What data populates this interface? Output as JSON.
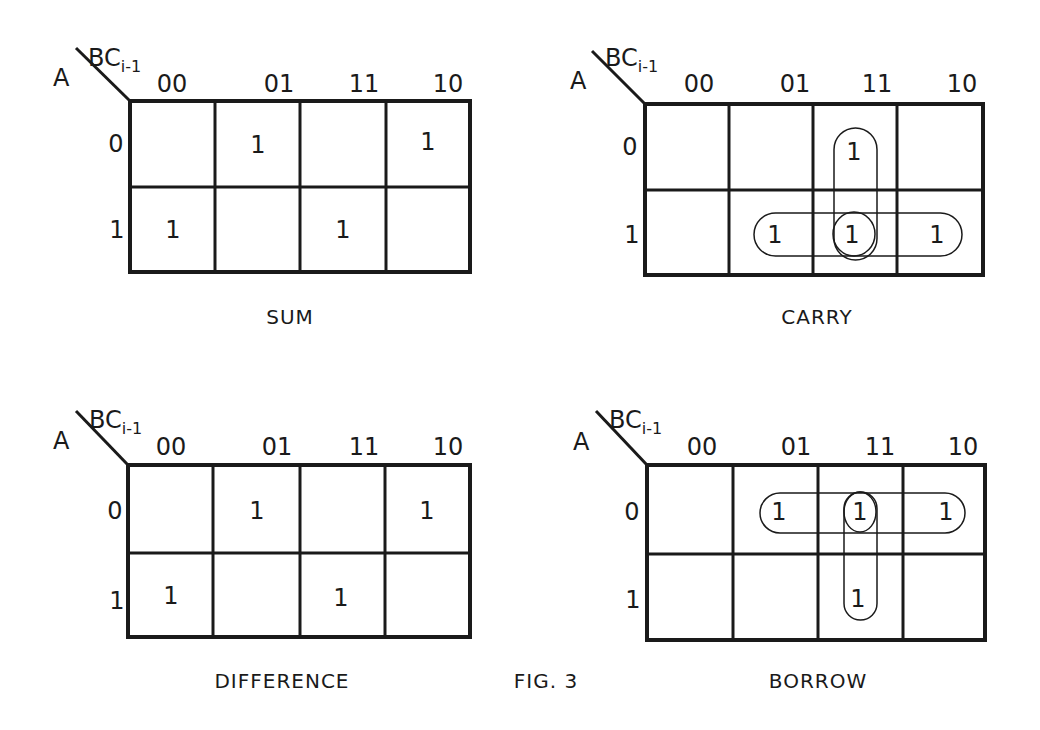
{
  "figure": {
    "label": "FIG. 3",
    "row_var": "A",
    "col_var": "BC",
    "col_var_sub": "i-1",
    "col_headers": [
      "00",
      "01",
      "11",
      "10"
    ],
    "row_headers": [
      "0",
      "1"
    ]
  },
  "maps": [
    {
      "id": "sum",
      "caption": "SUM",
      "cells": [
        [
          "",
          "1",
          "",
          "1"
        ],
        [
          "1",
          "",
          "1",
          ""
        ]
      ],
      "groups": []
    },
    {
      "id": "carry",
      "caption": "CARRY",
      "cells": [
        [
          "",
          "",
          "1",
          ""
        ],
        [
          "",
          "1",
          "1",
          "1"
        ]
      ],
      "groups": [
        {
          "type": "vertical",
          "col": "11",
          "rows": [
            "0",
            "1"
          ]
        },
        {
          "type": "horizontal",
          "row": "1",
          "cols": [
            "01",
            "11",
            "10"
          ]
        },
        {
          "type": "single",
          "row": "1",
          "col": "11"
        }
      ]
    },
    {
      "id": "difference",
      "caption": "DIFFERENCE",
      "cells": [
        [
          "",
          "1",
          "",
          "1"
        ],
        [
          "1",
          "",
          "1",
          ""
        ]
      ],
      "groups": []
    },
    {
      "id": "borrow",
      "caption": "BORROW",
      "cells": [
        [
          "",
          "1",
          "1",
          "1"
        ],
        [
          "",
          "",
          "1",
          ""
        ]
      ],
      "groups": [
        {
          "type": "horizontal",
          "row": "0",
          "cols": [
            "01",
            "11",
            "10"
          ]
        },
        {
          "type": "single",
          "row": "0",
          "col": "11"
        },
        {
          "type": "vertical",
          "col": "11",
          "rows": [
            "0",
            "1"
          ]
        }
      ]
    }
  ],
  "colors": {
    "ink": "#1a1a1a",
    "paper": "#ffffff"
  }
}
